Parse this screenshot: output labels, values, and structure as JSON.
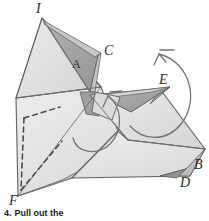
{
  "figure": {
    "kind": "origami-folding-diagram",
    "colors": {
      "background": "#ffffff",
      "paper_light": "#e9e9e9",
      "paper_mid": "#d6d6d6",
      "paper_shadow": "#bdbdbd",
      "paper_dark": "#a6a6a6",
      "paper_darkest": "#8f8f8f",
      "ink": "#4a4a4a",
      "ink_dark": "#2b2b2b",
      "label": "#2b2b2b"
    },
    "labels": [
      {
        "id": "I",
        "text": "I",
        "x": 36,
        "y": 2
      },
      {
        "id": "C",
        "text": "C",
        "x": 104,
        "y": 48
      },
      {
        "id": "A",
        "text": "A",
        "x": 72,
        "y": 60
      },
      {
        "id": "E",
        "text": "E",
        "x": 159,
        "y": 76
      },
      {
        "id": "B",
        "text": "B",
        "x": 194,
        "y": 163
      },
      {
        "id": "D",
        "text": "D",
        "x": 180,
        "y": 180
      },
      {
        "id": "F",
        "text": "F",
        "x": 9,
        "y": 197
      }
    ],
    "arrows": [
      {
        "id": "arrow-right",
        "note": "large curved arrow looping clockwise around corner E pointing up"
      },
      {
        "id": "arrow-center",
        "note": "curved arrow looping around center of model pointing up"
      }
    ]
  },
  "caption": {
    "step_number": "4.",
    "text": "Pull out the",
    "truncated": true
  }
}
